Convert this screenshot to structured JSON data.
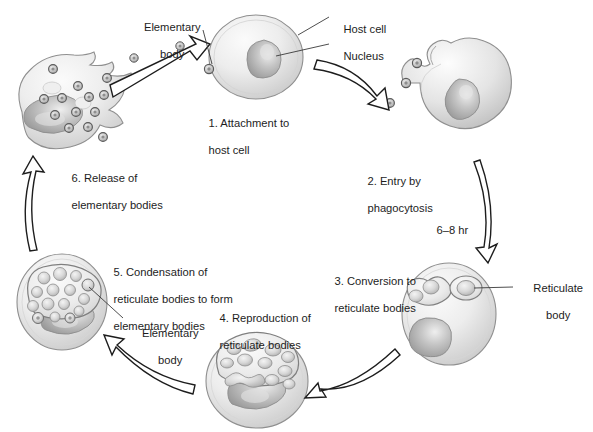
{
  "diagram": {
    "type": "cycle",
    "direction": "clockwise",
    "background_color": "#ffffff",
    "text_color": "#1d1d1d",
    "cell_fill": "#e9e9e9",
    "cell_stroke": "#8c8c8c",
    "nucleus_fill": "#b9b9b9",
    "body_fill": "#d2d2d2",
    "arrow_stroke": "#1d1d1d"
  },
  "steps": [
    {
      "id": "step1",
      "number": "1.",
      "line1": "1. Attachment to",
      "line2": "host cell"
    },
    {
      "id": "step2",
      "number": "2.",
      "line1": "2. Entry by",
      "line2": "phagocytosis"
    },
    {
      "id": "step3",
      "number": "3.",
      "line1": "3. Conversion to",
      "line2": "reticulate bodies"
    },
    {
      "id": "step4",
      "number": "4.",
      "line1": "4. Reproduction of",
      "line2": "reticulate bodies"
    },
    {
      "id": "step5",
      "number": "5.",
      "line1": "5. Condensation of",
      "line2": "reticulate bodies to form",
      "line3": "elementary bodies"
    },
    {
      "id": "step6",
      "number": "6.",
      "line1": "6. Release of",
      "line2": "elementary bodies"
    }
  ],
  "callouts": {
    "elementary_body_top": {
      "line1": "Elementary",
      "line2": "body"
    },
    "host_cell": {
      "line1": "Host cell"
    },
    "nucleus": {
      "line1": "Nucleus"
    },
    "reticulate_body": {
      "line1": "Reticulate",
      "line2": "body"
    },
    "elementary_body_mid": {
      "line1": "Elementary",
      "line2": "body"
    }
  },
  "timing": {
    "label": "6–8 hr"
  }
}
